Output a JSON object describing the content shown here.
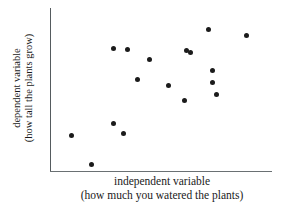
{
  "chart_data": {
    "type": "scatter",
    "title": "",
    "xlabel": "independent variable",
    "xlabel_sub": "(how much you watered the plants)",
    "ylabel": "dependent variable",
    "ylabel_sub": "(how tall the plants grow)",
    "grid": false,
    "legend": "none",
    "axis_ticks": "none",
    "xlim": [
      0,
      100
    ],
    "ylim": [
      0,
      100
    ],
    "relationship": "positive correlation",
    "point_color": "#1b1b1b",
    "axis_color": "#555b5e",
    "n_points": 17,
    "points": [
      {
        "x": 9.5,
        "y": 22.0
      },
      {
        "x": 18.5,
        "y": 4.3
      },
      {
        "x": 32.9,
        "y": 23.2
      },
      {
        "x": 28.4,
        "y": 75.6
      },
      {
        "x": 39.2,
        "y": 56.7
      },
      {
        "x": 28.4,
        "y": 29.3
      },
      {
        "x": 61.3,
        "y": 73.8
      },
      {
        "x": 45.0,
        "y": 68.3
      },
      {
        "x": 53.2,
        "y": 53.0
      },
      {
        "x": 73.4,
        "y": 61.6
      },
      {
        "x": 60.4,
        "y": 43.9
      },
      {
        "x": 73.4,
        "y": 54.3
      },
      {
        "x": 63.5,
        "y": 72.6
      },
      {
        "x": 74.8,
        "y": 47.0
      },
      {
        "x": 71.6,
        "y": 86.6
      },
      {
        "x": 88.7,
        "y": 83.5
      },
      {
        "x": 34.7,
        "y": 75.0
      }
    ]
  }
}
